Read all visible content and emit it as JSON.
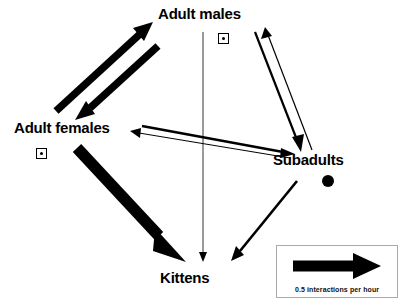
{
  "figure": {
    "type": "network-diagram",
    "title": "",
    "background_color": "#ffffff",
    "edge_color": "#000000"
  },
  "nodes": [
    {
      "id": "adult-males",
      "label": "Adult males",
      "self_marker": "square-with-dot"
    },
    {
      "id": "adult-females",
      "label": "Adult females",
      "self_marker": "square-with-dot"
    },
    {
      "id": "subadults",
      "label": "Subadults",
      "self_marker": "filled-circle"
    },
    {
      "id": "kittens",
      "label": "Kittens",
      "self_marker": "none"
    }
  ],
  "edges": [
    {
      "from": "adult-females",
      "to": "adult-males",
      "weight": "very-thick",
      "stroke": 7.5
    },
    {
      "from": "adult-males",
      "to": "adult-females",
      "weight": "very-thick",
      "stroke": 7.5
    },
    {
      "from": "adult-males",
      "to": "subadults",
      "weight": "thin",
      "stroke": 2.2
    },
    {
      "from": "subadults",
      "to": "adult-males",
      "weight": "very-thin",
      "stroke": 1.2
    },
    {
      "from": "adult-females",
      "to": "subadults",
      "weight": "thin",
      "stroke": 2.6
    },
    {
      "from": "subadults",
      "to": "adult-females",
      "weight": "very-thin",
      "stroke": 1.0
    },
    {
      "from": "adult-females",
      "to": "kittens",
      "weight": "thickest",
      "stroke": 11.5
    },
    {
      "from": "subadults",
      "to": "kittens",
      "weight": "medium",
      "stroke": 2.6
    },
    {
      "from": "adult-males",
      "to": "kittens",
      "weight": "hairline",
      "stroke": 0.8
    }
  ],
  "legend": {
    "caption": "0.5 interactions per hour",
    "arrow_label": "scale-arrow"
  }
}
